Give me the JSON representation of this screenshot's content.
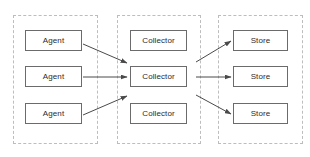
{
  "diagram": {
    "canvas": {
      "width": 310,
      "height": 157
    },
    "style": {
      "background_color": "#ffffff",
      "node_border_color": "#6b6b6b",
      "node_fill_color": "#ffffff",
      "node_text_color": "#2b2b2b",
      "zone_border_color": "#bdbdbd",
      "zone_border_style": "dashed",
      "edge_color": "#4a4a4a"
    },
    "zones": [
      {
        "id": "zone-agents",
        "name": "agent-tier",
        "label": "",
        "x": 13,
        "y": 15,
        "width": 85,
        "height": 129
      },
      {
        "id": "zone-collectors",
        "name": "collector-tier",
        "label": "",
        "x": 117,
        "y": 15,
        "width": 84,
        "height": 129
      },
      {
        "id": "zone-stores",
        "name": "store-tier",
        "label": "",
        "x": 218,
        "y": 15,
        "width": 85,
        "height": 129
      }
    ],
    "nodes": [
      {
        "id": "agent-1",
        "label": "Agent",
        "x": 25,
        "y": 30,
        "width": 57,
        "height": 21
      },
      {
        "id": "agent-2",
        "label": "Agent",
        "x": 25,
        "y": 66,
        "width": 57,
        "height": 21
      },
      {
        "id": "agent-3",
        "label": "Agent",
        "x": 25,
        "y": 103,
        "width": 57,
        "height": 21
      },
      {
        "id": "collector-1",
        "label": "Collector",
        "x": 130,
        "y": 30,
        "width": 57,
        "height": 21
      },
      {
        "id": "collector-2",
        "label": "Collector",
        "x": 130,
        "y": 66,
        "width": 57,
        "height": 21
      },
      {
        "id": "collector-3",
        "label": "Collector",
        "x": 130,
        "y": 103,
        "width": 57,
        "height": 21
      },
      {
        "id": "store-1",
        "label": "Store",
        "x": 233,
        "y": 30,
        "width": 55,
        "height": 21
      },
      {
        "id": "store-2",
        "label": "Store",
        "x": 233,
        "y": 66,
        "width": 55,
        "height": 21
      },
      {
        "id": "store-3",
        "label": "Store",
        "x": 233,
        "y": 103,
        "width": 55,
        "height": 21
      }
    ],
    "edges": [
      {
        "id": "edge-agent1-collector2",
        "from": "agent-1",
        "to": "collector-2",
        "x1": 83,
        "y1": 44,
        "x2": 127,
        "y2": 63
      },
      {
        "id": "edge-agent2-collector2",
        "from": "agent-2",
        "to": "collector-2",
        "x1": 83,
        "y1": 77,
        "x2": 127,
        "y2": 77
      },
      {
        "id": "edge-agent3-collector2",
        "from": "agent-3",
        "to": "collector-2",
        "x1": 83,
        "y1": 115,
        "x2": 127,
        "y2": 96
      },
      {
        "id": "edge-collector2-store1",
        "from": "collector-2",
        "to": "store-1",
        "x1": 196,
        "y1": 62,
        "x2": 231,
        "y2": 41
      },
      {
        "id": "edge-collector2-store2",
        "from": "collector-2",
        "to": "store-2",
        "x1": 196,
        "y1": 77,
        "x2": 231,
        "y2": 77
      },
      {
        "id": "edge-collector2-store3",
        "from": "collector-2",
        "to": "store-3",
        "x1": 196,
        "y1": 95,
        "x2": 231,
        "y2": 114
      }
    ]
  }
}
